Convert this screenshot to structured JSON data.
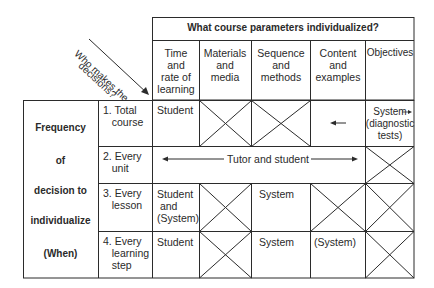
{
  "diagram": {
    "corner_label": {
      "line1": "Who makes the",
      "line2": "decisions?"
    },
    "column_group_header": "What course parameters individualized?",
    "columns": [
      {
        "label": "Time\nand\nrate of\nlearning"
      },
      {
        "label": "Materials\nand\nmedia"
      },
      {
        "label": "Sequence\nand\nmethods"
      },
      {
        "label": "Content\nand\nexamples"
      },
      {
        "label": "Objectives"
      }
    ],
    "row_group_label": {
      "lines": [
        "Frequency",
        "of",
        "decision to",
        "individualize",
        "(When)"
      ]
    },
    "rows": [
      {
        "label": "1. Total\n   course",
        "cells": [
          {
            "type": "text",
            "value": "Student"
          },
          {
            "type": "crossed"
          },
          {
            "type": "crossed"
          },
          {
            "type": "arrow-left"
          },
          {
            "type": "text",
            "value": "System\n(diagnostic\ntests)",
            "arrow": "right"
          }
        ]
      },
      {
        "label": "2. Every\n   unit",
        "span_text": "Tutor and student",
        "span_columns": 4,
        "cells": [
          {
            "type": "crossed"
          }
        ]
      },
      {
        "label": "3. Every\n   lesson",
        "cells": [
          {
            "type": "text",
            "value": "Student\n and\n(System)"
          },
          {
            "type": "crossed"
          },
          {
            "type": "text",
            "value": "System"
          },
          {
            "type": "crossed"
          },
          {
            "type": "crossed"
          }
        ]
      },
      {
        "label": "4. Every\n   learning\n   step",
        "cells": [
          {
            "type": "text",
            "value": "Student"
          },
          {
            "type": "crossed"
          },
          {
            "type": "text",
            "value": "System"
          },
          {
            "type": "text",
            "value": "(System)"
          },
          {
            "type": "crossed"
          }
        ]
      }
    ],
    "colors": {
      "line": "#2b2b2b",
      "text": "#2a2a2a",
      "background": "#ffffff"
    }
  }
}
